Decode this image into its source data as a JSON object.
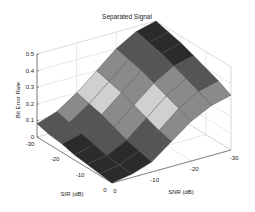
{
  "chart_data": {
    "type": "surface3d",
    "title": "Separated Signal",
    "xlabel": "SNR (dB)",
    "ylabel": "SIR (dB)",
    "zlabel": "Bit Error Rate",
    "x_ticks": [
      -30,
      -20,
      -10,
      0
    ],
    "y_ticks": [
      -30,
      -20,
      -10,
      0
    ],
    "z_ticks": [
      0,
      0.1,
      0.2,
      0.3,
      0.4,
      0.5
    ],
    "x_range": [
      -30,
      0
    ],
    "y_range": [
      -30,
      0
    ],
    "zlim": [
      0,
      0.5
    ],
    "grid": true,
    "colormap": "gray-banded",
    "x": [
      -30,
      -25,
      -20,
      -15,
      -10,
      -5,
      0
    ],
    "y": [
      -30,
      -25,
      -20,
      -15,
      -10,
      -5,
      0
    ],
    "z": [
      [
        0.5,
        0.47,
        0.4,
        0.3,
        0.2,
        0.12,
        0.08
      ],
      [
        0.48,
        0.45,
        0.38,
        0.28,
        0.18,
        0.1,
        0.06
      ],
      [
        0.46,
        0.43,
        0.36,
        0.26,
        0.16,
        0.08,
        0.05
      ],
      [
        0.43,
        0.4,
        0.33,
        0.23,
        0.13,
        0.06,
        0.03
      ],
      [
        0.4,
        0.37,
        0.3,
        0.2,
        0.1,
        0.04,
        0.02
      ],
      [
        0.37,
        0.34,
        0.27,
        0.17,
        0.08,
        0.03,
        0.01
      ],
      [
        0.33,
        0.3,
        0.24,
        0.15,
        0.06,
        0.02,
        0.0
      ]
    ],
    "z_note": "rows indexed by SIR (y), columns by SNR (x); values estimated from rendered surface"
  },
  "figure": {
    "background": "#ffffff",
    "axis_color": "#555555",
    "grid_color": "#d8d8d8",
    "edge_color": "#3a3a3a",
    "band_colors": [
      "#2b2b2b",
      "#555555",
      "#8a8a8a",
      "#d0d0d0",
      "#8a8a8a",
      "#555555",
      "#2b2b2b"
    ]
  }
}
